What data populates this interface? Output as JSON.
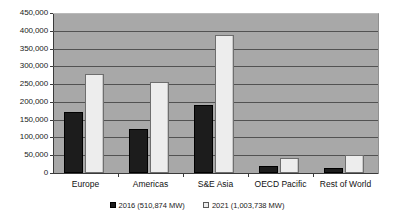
{
  "chart_data": {
    "type": "bar",
    "title": "",
    "subtitle": "",
    "xlabel": "",
    "ylabel": "",
    "categories": [
      "Europe",
      "Americas",
      "S&E Asia",
      "OECD Pacific",
      "Rest of World"
    ],
    "series": [
      {
        "name": "2016 (510,874  MW)",
        "values": [
          172000,
          124000,
          192000,
          20000,
          14000
        ],
        "color": "#1c1c1c"
      },
      {
        "name": "2021 (1,003,738  MW)",
        "values": [
          278000,
          256000,
          387000,
          43000,
          52000
        ],
        "color": "#ededed"
      }
    ],
    "ylim": [
      0,
      450000
    ],
    "ytick_step": 50000,
    "ytick_labels": [
      "450,000",
      "400,000",
      "350,000",
      "300,000",
      "250,000",
      "200,000",
      "150,000",
      "100,000",
      "50,000",
      "0"
    ],
    "ytick_values": [
      450000,
      400000,
      350000,
      300000,
      250000,
      200000,
      150000,
      100000,
      50000,
      0
    ],
    "grid": true,
    "grid_orientation": "horizontal",
    "legend_position": "bottom",
    "plot_background": "#a8a8a8",
    "axis_color": "#3a3a3a",
    "gridline_color": "#525252"
  },
  "legend": {
    "items": [
      {
        "label": "2016  (510,874  MW)",
        "swatch": "dark"
      },
      {
        "label": "2021  (1,003,738  MW)",
        "swatch": "light"
      }
    ]
  },
  "axis": {
    "y_labels": [
      "450,000",
      "400,000",
      "350,000",
      "300,000",
      "250,000",
      "200,000",
      "150,000",
      "100,000",
      "50,000",
      "0"
    ],
    "x_labels": [
      "Europe",
      "Americas",
      "S&E Asia",
      "OECD Pacific",
      "Rest of World"
    ]
  }
}
